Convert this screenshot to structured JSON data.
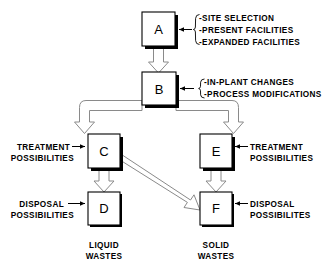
{
  "diagram": {
    "background_color": "#ffffff",
    "line_color": "#000000",
    "arrow_fill_color": "#ffffff",
    "arrow_outline_color": "#8a8a8a",
    "nodes": [
      {
        "id": "A",
        "label": "A"
      },
      {
        "id": "B",
        "label": "B"
      },
      {
        "id": "C",
        "label": "C"
      },
      {
        "id": "D",
        "label": "D"
      },
      {
        "id": "E",
        "label": "E"
      },
      {
        "id": "F",
        "label": "F"
      }
    ],
    "annotations": {
      "a_group": {
        "target": "A",
        "items": [
          "-SITE SELECTION",
          "-PRESENT  FACILITIES",
          "-EXPANDED  FACILITIES"
        ]
      },
      "b_group": {
        "target": "B",
        "items": [
          "-IN-PLANT CHANGES",
          "-PROCESS  MODIFICATIONS"
        ]
      },
      "c_label": {
        "target": "C",
        "line1": "TREATMENT",
        "line2": "POSSIBILITIES"
      },
      "d_label": {
        "target": "D",
        "line1": "DISPOSAL",
        "line2": "POSSIBILITIES"
      },
      "e_label": {
        "target": "E",
        "line1": "TREATMENT",
        "line2": "POSSIBILITIES"
      },
      "f_label": {
        "target": "F",
        "line1": "DISPOSAL",
        "line2": "POSSIBILITES"
      }
    },
    "captions": {
      "liquid": {
        "line1": "LIQUID",
        "line2": "WASTES"
      },
      "solid": {
        "line1": "SOLID",
        "line2": "WASTES"
      }
    },
    "edges": [
      {
        "from": "A",
        "to": "B",
        "style": "block-arrow-down"
      },
      {
        "from": "B",
        "to": "C",
        "style": "block-arrow-elbow-left"
      },
      {
        "from": "B",
        "to": "E",
        "style": "block-arrow-elbow-right"
      },
      {
        "from": "C",
        "to": "D",
        "style": "block-arrow-down"
      },
      {
        "from": "C",
        "to": "F",
        "style": "block-arrow-diagonal"
      },
      {
        "from": "E",
        "to": "F",
        "style": "block-arrow-down"
      }
    ]
  }
}
